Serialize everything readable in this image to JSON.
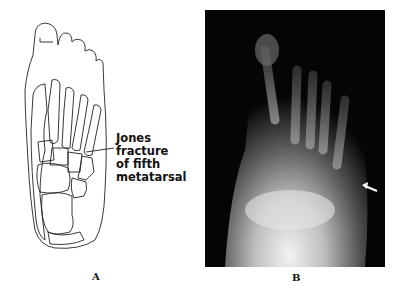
{
  "figure": {
    "panel_a": {
      "label": "A",
      "annotation": [
        "Jones",
        "fracture",
        "of fifth",
        "metatarsal"
      ],
      "description": "line drawing of foot skeleton, dorsal view"
    },
    "panel_b": {
      "label": "B",
      "description": "radiograph of foot with arrow indicating fracture",
      "arrow_color": "#ffffff"
    }
  }
}
